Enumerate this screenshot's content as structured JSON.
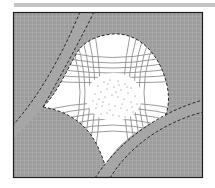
{
  "figure": {
    "colors": {
      "background": "#ffffff",
      "shaded_region": "#9a9a9a",
      "grid_lines": "#b4b4b4",
      "white_region": "#ffffff",
      "curvilinear_lines": "#8c8c8c",
      "dashed_boundary": "#2a2a2a",
      "frame": "#1e1e1e",
      "stipple": "#555555",
      "top_bar": "#c4c4c4"
    },
    "regions": [
      {
        "name": "shaded-gridded-domain"
      },
      {
        "name": "white-curvilinear-region"
      },
      {
        "name": "stippled-core"
      },
      {
        "name": "upper-left-band"
      },
      {
        "name": "lower-right-band"
      },
      {
        "name": "lower-left-lobe"
      }
    ]
  }
}
